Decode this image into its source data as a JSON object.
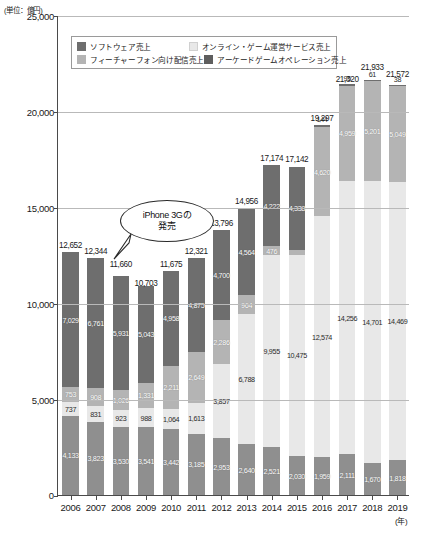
{
  "unit_note": "(単位：億円)",
  "axis_unit_note": "(年)",
  "legend": {
    "items": [
      {
        "key": "software",
        "label": "ソフトウェア売上",
        "color": "#6e6e6e"
      },
      {
        "key": "online",
        "label": "オンライン・ゲーム運営サービス売上",
        "color": "#e8e8e8"
      },
      {
        "key": "feature",
        "label": "フィーチャーフォン向け配信売上",
        "color": "#b4b4b4"
      },
      {
        "key": "arcade",
        "label": "アーケードゲームオペレーション売上",
        "color": "#5e5e5e"
      }
    ]
  },
  "callout": {
    "line1": "iPhone 3Gの",
    "line2": "発売"
  },
  "chart_data": {
    "type": "bar",
    "title": "",
    "xlabel": "(年)",
    "ylabel": "(単位：億円)",
    "stacked": true,
    "grid": true,
    "legend_position": "top-inside",
    "ylim": [
      0,
      25000
    ],
    "yticks": [
      0,
      5000,
      10000,
      15000,
      20000,
      25000
    ],
    "ytick_labels": [
      "0",
      "5,000",
      "10,000",
      "15,000",
      "20,000",
      "25,000"
    ],
    "categories": [
      "2006",
      "2007",
      "2008",
      "2009",
      "2010",
      "2011",
      "2012",
      "2013",
      "2014",
      "2015",
      "2016",
      "2017",
      "2018",
      "2019"
    ],
    "series": [
      {
        "name": "ソフトウェア売上",
        "key": "software",
        "color": "#6e6e6e",
        "values": [
          7029,
          6761,
          5931,
          5043,
          4958,
          4875,
          4700,
          4564,
          4222,
          4338,
          144,
          95,
          61,
          38
        ]
      },
      {
        "name": "フィーチャーフォン向け配信売上",
        "key": "feature",
        "color": "#b4b4b4",
        "values": [
          753,
          908,
          1026,
          1331,
          2211,
          2649,
          2286,
          964,
          476,
          249,
          4620,
          4959,
          5201,
          5049
        ]
      },
      {
        "name": "オンライン・ゲーム運営サービス売上",
        "key": "online",
        "color": "#e8e8e8",
        "values": [
          737,
          831,
          923,
          988,
          1064,
          1613,
          3857,
          6788,
          9955,
          10475,
          12574,
          14256,
          14701,
          14469
        ]
      },
      {
        "name": "アーケードゲームオペレーション売上",
        "key": "arcade",
        "color": "#8f8f8f",
        "values": [
          4133,
          3823,
          3530,
          3541,
          3442,
          3185,
          2953,
          2640,
          2521,
          2030,
          1959,
          2111,
          1670,
          1818
        ]
      }
    ],
    "totals": [
      12652,
      12344,
      11660,
      10703,
      11675,
      12321,
      13796,
      14956,
      17174,
      17142,
      19297,
      21320,
      21933,
      21572
    ],
    "total_labels": [
      "12,652",
      "12,344",
      "11,660",
      "10,703",
      "11,675",
      "12,321",
      "13,796",
      "14,956",
      "17,174",
      "17,142",
      "19,297",
      "21,320",
      "21,933",
      "21,572"
    ],
    "annotations": [
      {
        "text": "iPhone 3Gの発売",
        "points_to": "2009"
      }
    ]
  }
}
